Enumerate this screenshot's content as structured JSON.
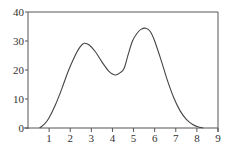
{
  "chart_data": {
    "type": "line",
    "title": "",
    "xlabel": "",
    "ylabel": "",
    "xlim": [
      0,
      9
    ],
    "ylim": [
      0,
      40
    ],
    "grid": false,
    "legend": null,
    "x_ticks": [
      1,
      2,
      3,
      4,
      5,
      6,
      7,
      8,
      9
    ],
    "x_tick_labels": [
      "1",
      "2",
      "3",
      "4",
      "5",
      "6",
      "7",
      "8",
      "9"
    ],
    "y_ticks": [
      0,
      10,
      20,
      30,
      40
    ],
    "y_tick_labels": [
      "0",
      "10",
      "20",
      "30",
      "40"
    ],
    "series": [
      {
        "name": "curve",
        "color": "#444444",
        "x": [
          0.55,
          0.8,
          1.0,
          1.3,
          1.6,
          1.9,
          2.2,
          2.45,
          2.66,
          2.9,
          3.2,
          3.5,
          3.8,
          4.0,
          4.17,
          4.35,
          4.55,
          4.75,
          4.95,
          5.15,
          5.35,
          5.58,
          5.8,
          6.0,
          6.3,
          6.6,
          6.9,
          7.2,
          7.5,
          7.8,
          8.05,
          8.3
        ],
        "y": [
          0,
          1.5,
          3.5,
          8,
          13.5,
          19.5,
          24.5,
          27.8,
          29.2,
          28.6,
          26.2,
          22.8,
          19.8,
          18.6,
          18.3,
          19.0,
          20.5,
          25.5,
          30.0,
          32.5,
          34.0,
          34.4,
          33.2,
          30.0,
          23.5,
          16.5,
          10.5,
          6.0,
          3.0,
          1.2,
          0.4,
          0
        ]
      }
    ]
  }
}
